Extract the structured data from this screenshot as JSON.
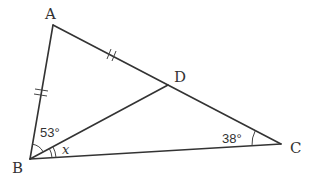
{
  "figure": {
    "type": "triangle-geometry-diagram",
    "vertices": {
      "A": {
        "label": "A"
      },
      "B": {
        "label": "B"
      },
      "C": {
        "label": "C"
      },
      "D": {
        "label": "D"
      }
    },
    "segments": [
      "AB",
      "AC",
      "BC",
      "BD"
    ],
    "point_D_on": "AC",
    "equal_marks": {
      "mark": "double-tick",
      "segments": [
        "AB",
        "AD"
      ]
    },
    "angles": {
      "ABD": {
        "label": "53°",
        "marks": "single-arc"
      },
      "DBC": {
        "label": "x",
        "marks": "double-arc"
      },
      "BCA": {
        "label": "38°",
        "marks": "single-arc"
      }
    },
    "colors": {
      "line": "#333333",
      "background": "#ffffff"
    }
  }
}
